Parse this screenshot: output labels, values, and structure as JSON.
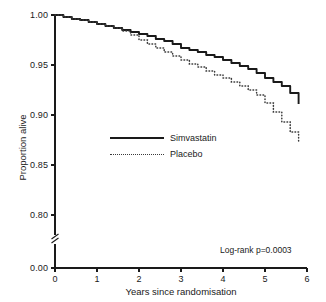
{
  "chart_data": {
    "type": "line",
    "title": "",
    "subtitle": "",
    "xlabel": "Years since randomisation",
    "ylabel": "Proportion alive",
    "xlim": [
      0,
      6
    ],
    "ylim": [
      0.0,
      1.0
    ],
    "y_axis_break": {
      "present": true,
      "below_value": 0.8,
      "resume_value": 0.0,
      "note": "axis break between 0.00 and 0.80"
    },
    "grid": false,
    "legend_position": "center-left inside axes",
    "x_ticks": [
      0,
      1,
      2,
      3,
      4,
      5,
      6
    ],
    "x_tick_labels": [
      "0",
      "1",
      "2",
      "3",
      "4",
      "5",
      "6"
    ],
    "y_ticks": [
      0.0,
      0.8,
      0.85,
      0.9,
      0.95,
      1.0
    ],
    "y_tick_labels": [
      "0.00",
      "0.80",
      "0.85",
      "0.90",
      "0.95",
      "1.00"
    ],
    "annotations": [
      {
        "name": "log-rank",
        "text": "Log-rank p=0.0003",
        "x": 4.9,
        "y": 0.806
      }
    ],
    "series": [
      {
        "name": "Simvastatin",
        "style": "solid",
        "color": "#1a1a1a",
        "x": [
          0.0,
          0.2,
          0.4,
          0.6,
          0.8,
          1.0,
          1.2,
          1.4,
          1.6,
          1.8,
          2.0,
          2.2,
          2.4,
          2.6,
          2.8,
          3.0,
          3.2,
          3.4,
          3.6,
          3.8,
          4.0,
          4.2,
          4.4,
          4.6,
          4.8,
          5.0,
          5.2,
          5.4,
          5.6,
          5.8
        ],
        "y": [
          1.0,
          0.998,
          0.996,
          0.995,
          0.993,
          0.991,
          0.989,
          0.987,
          0.985,
          0.983,
          0.981,
          0.979,
          0.976,
          0.974,
          0.971,
          0.967,
          0.965,
          0.963,
          0.96,
          0.958,
          0.955,
          0.952,
          0.949,
          0.946,
          0.942,
          0.937,
          0.933,
          0.929,
          0.922,
          0.911
        ]
      },
      {
        "name": "Placebo",
        "style": "dotted",
        "color": "#3a3a3a",
        "x": [
          0.0,
          0.2,
          0.4,
          0.6,
          0.8,
          1.0,
          1.2,
          1.4,
          1.6,
          1.8,
          2.0,
          2.2,
          2.4,
          2.6,
          2.8,
          3.0,
          3.2,
          3.4,
          3.6,
          3.8,
          4.0,
          4.2,
          4.4,
          4.6,
          4.8,
          5.0,
          5.2,
          5.4,
          5.6,
          5.8
        ],
        "y": [
          1.0,
          0.998,
          0.996,
          0.995,
          0.993,
          0.991,
          0.989,
          0.987,
          0.984,
          0.98,
          0.975,
          0.971,
          0.967,
          0.963,
          0.959,
          0.955,
          0.951,
          0.948,
          0.944,
          0.94,
          0.937,
          0.933,
          0.929,
          0.925,
          0.92,
          0.912,
          0.903,
          0.893,
          0.883,
          0.872
        ]
      }
    ]
  },
  "legend": {
    "items": [
      {
        "label": "Simvastatin",
        "style": "solid"
      },
      {
        "label": "Placebo",
        "style": "dotted"
      }
    ]
  },
  "colors": {
    "background": "#ffffff",
    "axis": "#1a1a1a",
    "simvastatin": "#1a1a1a",
    "placebo": "#3a3a3a"
  }
}
